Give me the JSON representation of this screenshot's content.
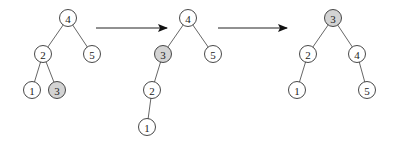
{
  "diagram": {
    "title": "",
    "colors": {
      "highlight": "#d3d3d3",
      "normal": "#ffffff",
      "stroke": "#333333"
    },
    "trees": [
      {
        "nodes": [
          {
            "id": "t1n4",
            "label": "4",
            "x": 68,
            "y": 18,
            "highlight": false
          },
          {
            "id": "t1n2",
            "label": "2",
            "x": 43,
            "y": 54,
            "highlight": false
          },
          {
            "id": "t1n5",
            "label": "5",
            "x": 92,
            "y": 54,
            "highlight": false
          },
          {
            "id": "t1n1",
            "label": "1",
            "x": 32,
            "y": 90,
            "highlight": false
          },
          {
            "id": "t1n3",
            "label": "3",
            "x": 57,
            "y": 90,
            "highlight": true
          }
        ],
        "edges": [
          [
            "t1n4",
            "t1n2"
          ],
          [
            "t1n4",
            "t1n5"
          ],
          [
            "t1n2",
            "t1n1"
          ],
          [
            "t1n2",
            "t1n3"
          ]
        ]
      },
      {
        "nodes": [
          {
            "id": "t2n4",
            "label": "4",
            "x": 188,
            "y": 18,
            "highlight": false
          },
          {
            "id": "t2n3",
            "label": "3",
            "x": 163,
            "y": 54,
            "highlight": true
          },
          {
            "id": "t2n5",
            "label": "5",
            "x": 213,
            "y": 54,
            "highlight": false
          },
          {
            "id": "t2n2",
            "label": "2",
            "x": 152,
            "y": 90,
            "highlight": false
          },
          {
            "id": "t2n1",
            "label": "1",
            "x": 147,
            "y": 127,
            "highlight": false
          }
        ],
        "edges": [
          [
            "t2n4",
            "t2n3"
          ],
          [
            "t2n4",
            "t2n5"
          ],
          [
            "t2n3",
            "t2n2"
          ],
          [
            "t2n2",
            "t2n1"
          ]
        ]
      },
      {
        "nodes": [
          {
            "id": "t3n3",
            "label": "3",
            "x": 333,
            "y": 18,
            "highlight": true
          },
          {
            "id": "t3n2",
            "label": "2",
            "x": 308,
            "y": 54,
            "highlight": false
          },
          {
            "id": "t3n4",
            "label": "4",
            "x": 357,
            "y": 54,
            "highlight": false
          },
          {
            "id": "t3n1",
            "label": "1",
            "x": 297,
            "y": 90,
            "highlight": false
          },
          {
            "id": "t3n5",
            "label": "5",
            "x": 367,
            "y": 90,
            "highlight": false
          }
        ],
        "edges": [
          [
            "t3n3",
            "t3n2"
          ],
          [
            "t3n3",
            "t3n4"
          ],
          [
            "t3n2",
            "t3n1"
          ],
          [
            "t3n4",
            "t3n5"
          ]
        ]
      }
    ],
    "arrows": [
      {
        "x1": 96,
        "y1": 28,
        "x2": 167,
        "y2": 28
      },
      {
        "x1": 218,
        "y1": 28,
        "x2": 287,
        "y2": 28
      }
    ]
  }
}
